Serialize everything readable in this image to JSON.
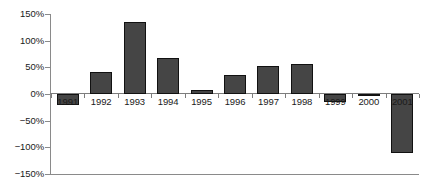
{
  "chart_data": {
    "type": "bar",
    "title": "",
    "subtitle": "",
    "xlabel": "",
    "ylabel": "",
    "categories": [
      "1991",
      "1992",
      "1993",
      "1994",
      "1995",
      "1996",
      "1997",
      "1998",
      "1999",
      "2000",
      "2001"
    ],
    "values": [
      -20,
      42,
      135,
      67,
      8,
      35,
      53,
      57,
      -15,
      -3,
      -110
    ],
    "value_format": "percent",
    "ylim": [
      -150,
      150
    ],
    "ytick_labels": [
      "150%",
      "100%",
      "50%",
      "0%",
      "-50%",
      "-100%",
      "-150%"
    ],
    "ytick_values": [
      150,
      100,
      50,
      0,
      -50,
      -100,
      -150
    ],
    "grid": false,
    "legend": null,
    "legend_position": "none",
    "series": [
      {
        "name": "",
        "values": [
          -20,
          42,
          135,
          67,
          8,
          35,
          53,
          57,
          -15,
          -3,
          -110
        ]
      }
    ]
  },
  "style": {
    "bar_fill": "#454545",
    "bar_stroke": "#111111",
    "axis_color": "#8a8a8a",
    "zero_line_color": "#7d7d7d",
    "text_color": "#1a1a1a",
    "background": "#ffffff"
  }
}
